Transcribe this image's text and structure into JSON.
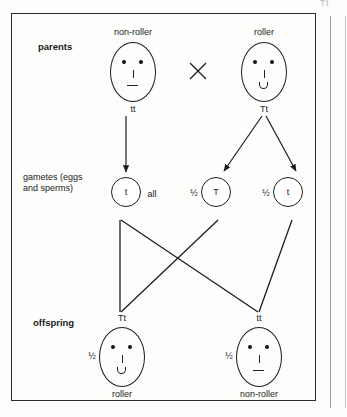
{
  "figure": {
    "title_mark": "Tt",
    "row_labels": {
      "parents": "parents",
      "gametes": "gametes (eggs\nand sperms)",
      "offspring": "offspring"
    },
    "cross_symbol": "×"
  },
  "parents": [
    {
      "id": "parent-non-roller",
      "phenotype": "non-roller",
      "genotype": "tt",
      "mouth": "flat",
      "x": 133
    },
    {
      "id": "parent-roller",
      "phenotype": "roller",
      "genotype": "Tt",
      "mouth": "rolled",
      "x": 264
    }
  ],
  "gametes": [
    {
      "id": "gamete-t-left",
      "allele": "t",
      "proportion": "all",
      "proportion_side": "right",
      "x": 126
    },
    {
      "id": "gamete-T",
      "allele": "T",
      "proportion": "½",
      "proportion_side": "left",
      "x": 216
    },
    {
      "id": "gamete-t-right",
      "allele": "t",
      "proportion": "½",
      "proportion_side": "left",
      "x": 288
    }
  ],
  "offspring": [
    {
      "id": "offspring-Tt",
      "genotype": "Tt",
      "phenotype": "roller",
      "proportion": "½",
      "mouth": "rolled",
      "x": 122
    },
    {
      "id": "offspring-tt",
      "genotype": "tt",
      "phenotype": "non-roller",
      "proportion": "½",
      "mouth": "flat",
      "x": 259
    }
  ],
  "colors": {
    "ink": "#1a1a1a",
    "frame": "#2b2b2b",
    "paper": "#fdfdfc"
  }
}
